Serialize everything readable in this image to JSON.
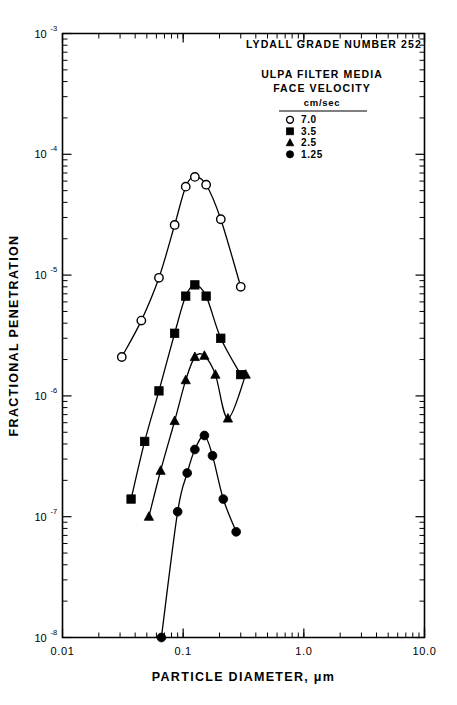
{
  "figure": {
    "title": "LYDALL GRADE NUMBER 252",
    "subtitle_line1": "ULPA FILTER MEDIA",
    "subtitle_line2": "FACE VELOCITY",
    "units_label": "cm/sec"
  },
  "chart_data": {
    "type": "line",
    "title": "LYDALL GRADE NUMBER 252",
    "subtitle": "ULPA FILTER MEDIA FACE VELOCITY cm/sec",
    "xlabel": "PARTICLE DIAMETER, μm",
    "ylabel": "FRACTIONAL PENETRATION",
    "xscale": "log",
    "yscale": "log",
    "xlim": [
      0.01,
      10.0
    ],
    "ylim": [
      1e-08,
      0.001
    ],
    "grid": false,
    "legend_position": "top-right",
    "x_tick_labels": [
      "0.01",
      "0.1",
      "1.0",
      "10.0"
    ],
    "x_tick_values": [
      0.01,
      0.1,
      1.0,
      10.0
    ],
    "y_tick_labels": [
      "10-3",
      "10-4",
      "10-5",
      "10-6",
      "10-7",
      "10-8"
    ],
    "y_tick_mantissa": "10",
    "y_tick_exponents": [
      "-3",
      "-4",
      "-5",
      "-6",
      "-7",
      "-8"
    ],
    "y_tick_values": [
      0.001,
      0.0001,
      1e-05,
      1e-06,
      1e-07,
      1e-08
    ],
    "series": [
      {
        "name": "7.0",
        "legend_label": "7.0",
        "marker": "open-circle",
        "x": [
          0.031,
          0.045,
          0.063,
          0.085,
          0.105,
          0.125,
          0.155,
          0.205,
          0.3
        ],
        "y": [
          2.1e-06,
          4.2e-06,
          9.5e-06,
          2.6e-05,
          5.4e-05,
          6.5e-05,
          5.6e-05,
          2.9e-05,
          8e-06
        ]
      },
      {
        "name": "3.5",
        "legend_label": "3.5",
        "marker": "filled-square",
        "x": [
          0.037,
          0.048,
          0.063,
          0.085,
          0.105,
          0.125,
          0.155,
          0.205,
          0.3
        ],
        "y": [
          1.4e-07,
          4.2e-07,
          1.1e-06,
          3.3e-06,
          6.7e-06,
          8.3e-06,
          6.7e-06,
          3e-06,
          1.5e-06
        ]
      },
      {
        "name": "2.5",
        "legend_label": "2.5",
        "marker": "filled-triangle",
        "x": [
          0.052,
          0.065,
          0.085,
          0.105,
          0.125,
          0.15,
          0.185,
          0.235,
          0.33
        ],
        "y": [
          1e-07,
          2.4e-07,
          6.2e-07,
          1.35e-06,
          2.1e-06,
          2.15e-06,
          1.5e-06,
          6.5e-07,
          1.5e-06
        ]
      },
      {
        "name": "1.25",
        "legend_label": "1.25",
        "marker": "filled-circle",
        "x": [
          0.066,
          0.09,
          0.108,
          0.125,
          0.15,
          0.175,
          0.215,
          0.275
        ],
        "y": [
          1e-08,
          1.1e-07,
          2.3e-07,
          3.6e-07,
          4.7e-07,
          3.2e-07,
          1.4e-07,
          7.5e-08
        ]
      }
    ]
  },
  "legend": {
    "header_line1": "ULPA FILTER MEDIA",
    "header_line2": "FACE VELOCITY",
    "units": "cm/sec",
    "entries": [
      {
        "marker": "open-circle",
        "label": "7.0"
      },
      {
        "marker": "filled-square",
        "label": "3.5"
      },
      {
        "marker": "filled-triangle",
        "label": "2.5"
      },
      {
        "marker": "filled-circle",
        "label": "1.25"
      }
    ]
  },
  "axes": {
    "x_title": "PARTICLE DIAMETER, μm",
    "y_title": "FRACTIONAL PENETRATION"
  }
}
